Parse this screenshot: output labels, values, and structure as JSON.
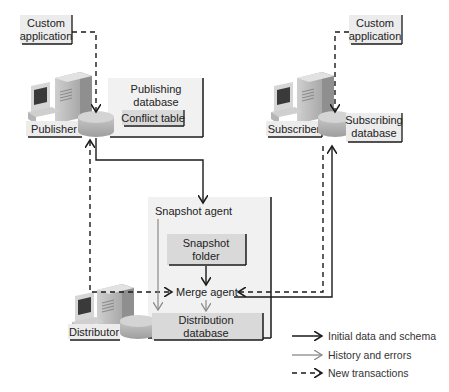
{
  "diagram": {
    "type": "merge-replication-architecture",
    "nodes": {
      "custom_app_left": {
        "line1": "Custom",
        "line2": "application"
      },
      "custom_app_right": {
        "line1": "Custom",
        "line2": "application"
      },
      "publisher": {
        "label": "Publisher"
      },
      "publishing_db": {
        "line1": "Publishing",
        "line2": "database"
      },
      "conflict_table": {
        "label": "Conflict table"
      },
      "subscriber": {
        "label": "Subscriber"
      },
      "subscribing_db": {
        "line1": "Subscribing",
        "line2": "database"
      },
      "snapshot_agent": {
        "label": "Snapshot agent"
      },
      "snapshot_folder": {
        "line1": "Snapshot",
        "line2": "folder"
      },
      "merge_agent": {
        "label": "Merge agent"
      },
      "distributor": {
        "label": "Distributor"
      },
      "distribution_db": {
        "line1": "Distribution",
        "line2": "database"
      }
    },
    "edges": [
      {
        "from": "custom_app_left",
        "to": "publisher",
        "style": "dashed"
      },
      {
        "from": "custom_app_right",
        "to": "subscriber",
        "style": "dashed"
      },
      {
        "from": "publisher",
        "to": "snapshot_agent",
        "style": "solid"
      },
      {
        "from": "snapshot_folder",
        "to": "merge_agent",
        "style": "solid"
      },
      {
        "from": "merge_agent",
        "to": "subscriber",
        "style": "solid"
      },
      {
        "from": "merge_agent",
        "to": "distribution_db",
        "style": "gray"
      },
      {
        "from": "snapshot_agent",
        "to": "distribution_db",
        "style": "gray"
      },
      {
        "from": "distributor",
        "to": "publisher",
        "style": "dashed"
      },
      {
        "from": "distributor",
        "to": "merge_agent",
        "style": "dashed"
      },
      {
        "from": "subscriber",
        "to": "merge_agent",
        "style": "dashed"
      }
    ],
    "colors": {
      "solid": "#1a1a1a",
      "gray": "#8a8a8a",
      "panel": "#f0f0f0",
      "box": "#d9d9d9"
    }
  },
  "legend": {
    "items": [
      {
        "label": "Initial data and schema",
        "style": "solid"
      },
      {
        "label": "History and errors",
        "style": "gray"
      },
      {
        "label": "New transactions",
        "style": "dashed"
      }
    ]
  }
}
